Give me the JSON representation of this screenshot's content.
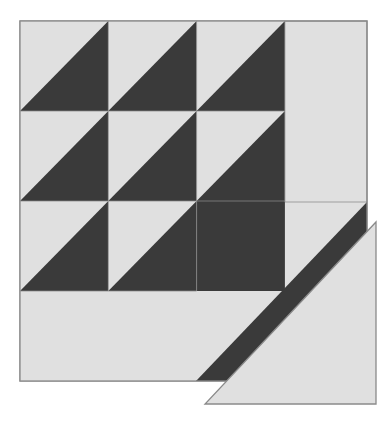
{
  "canvas": {
    "width": 391,
    "height": 421,
    "background": "#ffffff",
    "title": "Quilt block half-square triangle pattern"
  },
  "palette": {
    "light": "#e0e0e0",
    "dark": "#3a3a3a",
    "outline": "#8a8a8a",
    "background": "#ffffff"
  },
  "chart_data": {
    "type": "diagram",
    "xlabel": "",
    "ylabel": "",
    "grid": {
      "rows": 3,
      "cols": 3,
      "origin_x": 20,
      "origin_y": 21,
      "cell_width": 88.3,
      "cell_height": 90.0
    },
    "legend": [
      {
        "name": "light fabric",
        "color": "#e0e0e0"
      },
      {
        "name": "dark fabric",
        "color": "#3a3a3a"
      }
    ],
    "cells": [
      {
        "row": 1,
        "col": 1,
        "type": "half-square-triangle",
        "light_corner": "top-left",
        "dark_corner": "bottom-right"
      },
      {
        "row": 1,
        "col": 2,
        "type": "half-square-triangle",
        "light_corner": "top-left",
        "dark_corner": "bottom-right"
      },
      {
        "row": 1,
        "col": 3,
        "type": "half-square-triangle",
        "light_corner": "top-left",
        "dark_corner": "bottom-right"
      },
      {
        "row": 2,
        "col": 1,
        "type": "half-square-triangle",
        "light_corner": "top-left",
        "dark_corner": "bottom-right"
      },
      {
        "row": 2,
        "col": 2,
        "type": "half-square-triangle",
        "light_corner": "top-left",
        "dark_corner": "bottom-right"
      },
      {
        "row": 2,
        "col": 3,
        "type": "half-square-triangle",
        "light_corner": "top-left",
        "dark_corner": "bottom-right"
      },
      {
        "row": 3,
        "col": 1,
        "type": "half-square-triangle",
        "light_corner": "top-left",
        "dark_corner": "bottom-right"
      },
      {
        "row": 3,
        "col": 2,
        "type": "half-square-triangle",
        "light_corner": "top-left",
        "dark_corner": "bottom-right"
      },
      {
        "row": 3,
        "col": 3,
        "type": "solid",
        "fill": "dark"
      }
    ],
    "regions": [
      {
        "name": "outer-block",
        "shape": "rect",
        "points": "20,21 367,21 367,381 20,381",
        "fill": "light"
      },
      {
        "name": "right-column-light",
        "shape": "rect",
        "points": "285,21 367,21 367,202 285,202",
        "fill": "light"
      },
      {
        "name": "bottom-left-light",
        "shape": "rect",
        "points": "20,291 196,291 196,381 20,381",
        "fill": "light"
      },
      {
        "name": "bottom-right-dark-triangle",
        "shape": "triangle",
        "points": "367,202 367,381 196,381",
        "fill": "dark"
      },
      {
        "name": "detached-light-triangle",
        "shape": "triangle",
        "points": "376,222 376,404 205,404",
        "fill": "light"
      }
    ]
  },
  "shapes": {
    "outer_block": {
      "x": 20,
      "y": 21,
      "width": 347,
      "height": 360
    },
    "detached_triangle": {
      "points": "376,222 376,404 205,404"
    }
  }
}
